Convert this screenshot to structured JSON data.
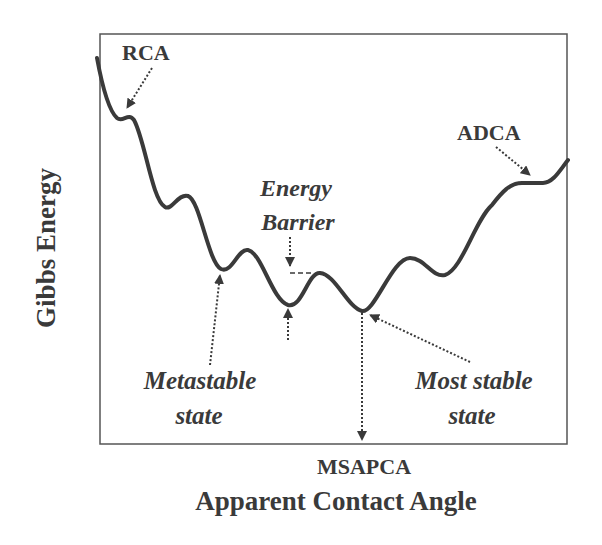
{
  "diagram": {
    "type": "energy-landscape",
    "y_axis_label": "Gibbs Energy",
    "x_axis_label": "Apparent Contact Angle",
    "x_marker_label": "MSAPCA",
    "annotations": {
      "rca": "RCA",
      "adca": "ADCA",
      "energy_barrier_line1": "Energy",
      "energy_barrier_line2": "Barrier",
      "metastable_line1": "Metastable",
      "metastable_line2": "state",
      "most_stable_line1": "Most stable",
      "most_stable_line2": "state"
    },
    "colors": {
      "curve": "#3a3a3a",
      "frame": "#555555",
      "text": "#3a3a3a",
      "background": "#ffffff"
    }
  }
}
